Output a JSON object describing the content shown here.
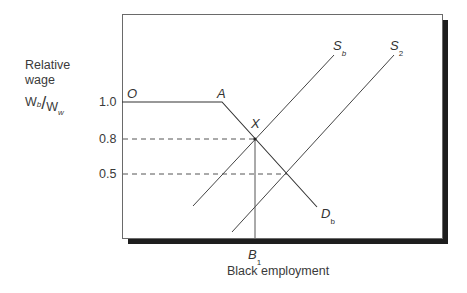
{
  "diagram": {
    "y_axis": {
      "label_line1": "Relative",
      "label_line2": "wage",
      "ratio_num": "W",
      "ratio_num_sub": "b",
      "ratio_slash": "/",
      "ratio_den": "W",
      "ratio_den_sub": "w",
      "ticks": [
        "1.0",
        "0.8",
        "0.5"
      ]
    },
    "x_axis": {
      "label": "Black employment",
      "tick_label": "B",
      "tick_label_sub": "1"
    },
    "points": {
      "origin": "O",
      "kink": "A",
      "equilibrium": "X"
    },
    "curves": {
      "supply_1": {
        "label": "S",
        "sub": "b"
      },
      "supply_2": {
        "label": "S",
        "sub": "2"
      },
      "demand": {
        "label": "D",
        "sub": "b"
      }
    },
    "values": {
      "wage_ratio_top": 1.0,
      "wage_ratio_equilibrium": 0.8,
      "wage_ratio_new": 0.5
    }
  }
}
